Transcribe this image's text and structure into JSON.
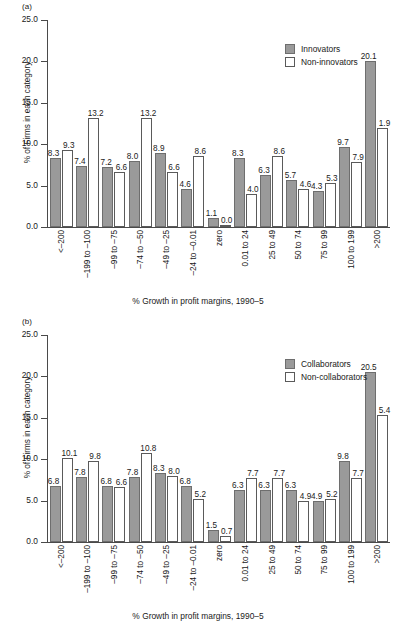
{
  "figure": {
    "panel_a_label": "(a)",
    "panel_b_label": "(b)",
    "axis_colors": {
      "series_innovators": "#9a9a9a",
      "series_non_innovators": "#ffffff",
      "axis": "#4a4a4a",
      "text": "#1a1a1a"
    }
  },
  "chart_data": [
    {
      "type": "bar",
      "panel": "(a)",
      "title": "",
      "xlabel": "% Growth in profit margins, 1990–5",
      "ylabel": "% of Firms in each category",
      "ylim": [
        0,
        25
      ],
      "yticks": [
        "0.0",
        "5.0",
        "10.0",
        "15.0",
        "20.0",
        "25.0"
      ],
      "ytick_values": [
        0,
        5,
        10,
        15,
        20,
        25
      ],
      "grid": false,
      "legend_position": "top-right",
      "categories": [
        "<–200",
        "–199 to –100",
        "–99 to –75",
        "–74 to –50",
        "–49 to –25",
        "–24 to –0.01",
        "zero",
        "0.01 to 24",
        "25 to 49",
        "50 to 74",
        "75 to 99",
        "100 to 199",
        ">200"
      ],
      "series": [
        {
          "name": "Innovators",
          "labels": [
            "8.3",
            "7.4",
            "7.2",
            "8.0",
            "8.9",
            "4.6",
            "1.1",
            "8.3",
            "6.3",
            "5.7",
            "4.3",
            "9.7",
            "20.1"
          ],
          "values": [
            8.3,
            7.4,
            7.2,
            8.0,
            8.9,
            4.6,
            1.1,
            8.3,
            6.3,
            5.7,
            4.3,
            9.7,
            20.1
          ],
          "plotted": [
            8.3,
            7.4,
            7.2,
            8.0,
            8.9,
            4.6,
            1.1,
            8.3,
            6.3,
            5.7,
            4.3,
            9.7,
            20.1
          ]
        },
        {
          "name": "Non-innovators",
          "labels": [
            "9.3",
            "13.2",
            "6.6",
            "13.2",
            "6.6",
            "8.6",
            "0.0",
            "4.0",
            "8.6",
            "4.6",
            "5.3",
            "7.9",
            "1.9"
          ],
          "values": [
            9.3,
            13.2,
            6.6,
            13.2,
            6.6,
            8.6,
            0.0,
            4.0,
            8.6,
            4.6,
            5.3,
            7.9,
            1.9
          ],
          "plotted": [
            9.3,
            13.2,
            6.6,
            13.2,
            6.6,
            8.6,
            0.0,
            4.0,
            8.6,
            4.6,
            5.3,
            7.9,
            11.9
          ]
        }
      ]
    },
    {
      "type": "bar",
      "panel": "(b)",
      "title": "",
      "xlabel": "% Growth in profit margins, 1990–5",
      "ylabel": "% of Firms in each category",
      "ylim": [
        0,
        25
      ],
      "yticks": [
        "0.0",
        "5.0",
        "10.0",
        "15.0",
        "20.0",
        "25.0"
      ],
      "ytick_values": [
        0,
        5,
        10,
        15,
        20,
        25
      ],
      "grid": false,
      "legend_position": "top-right",
      "categories": [
        "<–200",
        "–199 to –100",
        "–99 to –75",
        "–74 to –50",
        "–49 to –25",
        "–24 to –0.01",
        "zero",
        "0.01 to 24",
        "25 to 49",
        "50 to 74",
        "75 to 99",
        "100 to 199",
        ">200"
      ],
      "series": [
        {
          "name": "Collaborators",
          "labels": [
            "6.8",
            "7.8",
            "6.8",
            "7.8",
            "8.3",
            "6.8",
            "1.5",
            "6.3",
            "6.3",
            "6.3",
            "4.9",
            "9.8",
            "20.5"
          ],
          "values": [
            6.8,
            7.8,
            6.8,
            7.8,
            8.3,
            6.8,
            1.5,
            6.3,
            6.3,
            6.3,
            4.9,
            9.8,
            20.5
          ],
          "plotted": [
            6.8,
            7.8,
            6.8,
            7.8,
            8.3,
            6.8,
            1.5,
            6.3,
            6.3,
            6.3,
            4.9,
            9.8,
            20.5
          ]
        },
        {
          "name": "Non-collaborators",
          "labels": [
            "10.1",
            "9.8",
            "6.6",
            "10.8",
            "8.0",
            "5.2",
            "0.7",
            "7.7",
            "7.7",
            "4.9",
            "5.2",
            "7.7",
            "5.4"
          ],
          "values": [
            10.1,
            9.8,
            6.6,
            10.8,
            8.0,
            5.2,
            0.7,
            7.7,
            7.7,
            4.9,
            5.2,
            7.7,
            5.4
          ],
          "plotted": [
            10.1,
            9.8,
            6.6,
            10.8,
            8.0,
            5.2,
            0.7,
            7.7,
            7.7,
            4.9,
            5.2,
            7.7,
            15.4
          ]
        }
      ]
    }
  ]
}
